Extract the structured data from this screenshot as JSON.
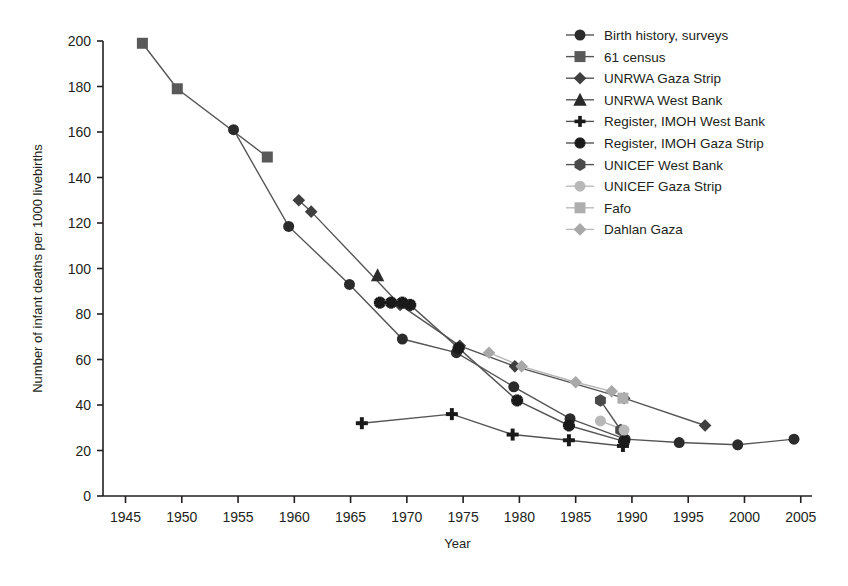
{
  "chart_data": {
    "type": "scatter",
    "title": "",
    "subtitle": "",
    "xlabel": "Year",
    "ylabel": "Number of infant deaths per 1000 livebirths",
    "xlim": [
      1943,
      2006
    ],
    "ylim": [
      0,
      200
    ],
    "xticks": [
      1945,
      1950,
      1955,
      1960,
      1965,
      1970,
      1975,
      1980,
      1985,
      1990,
      1995,
      2000,
      2005
    ],
    "yticks": [
      0,
      20,
      40,
      60,
      80,
      100,
      120,
      140,
      160,
      180,
      200
    ],
    "grid": false,
    "legend_position": "top-right",
    "series": [
      {
        "name": "Birth history, surveys",
        "marker": "circle",
        "color": "#2b2b2b",
        "size": 11,
        "connected": true,
        "points": [
          {
            "x": 1954.6,
            "y": 161
          },
          {
            "x": 1959.5,
            "y": 118.5
          },
          {
            "x": 1964.9,
            "y": 93
          },
          {
            "x": 1969.6,
            "y": 69
          },
          {
            "x": 1974.4,
            "y": 63
          },
          {
            "x": 1979.5,
            "y": 48
          },
          {
            "x": 1984.5,
            "y": 34
          },
          {
            "x": 1989.4,
            "y": 25
          },
          {
            "x": 1994.2,
            "y": 23.5
          },
          {
            "x": 1999.4,
            "y": 22.5
          },
          {
            "x": 2004.4,
            "y": 25
          }
        ]
      },
      {
        "name": "61 census",
        "marker": "square",
        "color": "#595959",
        "size": 11,
        "connected": true,
        "points": [
          {
            "x": 1946.5,
            "y": 199
          },
          {
            "x": 1949.6,
            "y": 179
          },
          {
            "x": 1957.6,
            "y": 149
          }
        ]
      },
      {
        "name": "UNRWA Gaza Strip",
        "marker": "diamond",
        "color": "#3f3f3f",
        "size": 11,
        "connected": true,
        "points": [
          {
            "x": 1960.4,
            "y": 130
          },
          {
            "x": 1961.5,
            "y": 125
          },
          {
            "x": 1969.4,
            "y": 84
          },
          {
            "x": 1974.7,
            "y": 66
          },
          {
            "x": 1979.6,
            "y": 57
          },
          {
            "x": 1989.3,
            "y": 43
          },
          {
            "x": 1996.5,
            "y": 31
          }
        ]
      },
      {
        "name": "UNRWA West Bank",
        "marker": "triangle",
        "color": "#2b2b2b",
        "size": 11,
        "connected": false,
        "points": [
          {
            "x": 1967.4,
            "y": 97
          }
        ]
      },
      {
        "name": "Register, IMOH West Bank",
        "marker": "plus",
        "color": "#1a1a1a",
        "size": 12,
        "connected": true,
        "points": [
          {
            "x": 1966.0,
            "y": 32
          },
          {
            "x": 1974.0,
            "y": 36
          },
          {
            "x": 1979.4,
            "y": 27
          },
          {
            "x": 1984.4,
            "y": 24.5
          },
          {
            "x": 1989.2,
            "y": 22
          }
        ]
      },
      {
        "name": "Register, IMOH Gaza Strip",
        "marker": "cross",
        "color": "#1a1a1a",
        "size": 12,
        "connected": true,
        "points": [
          {
            "x": 1967.6,
            "y": 85
          },
          {
            "x": 1968.6,
            "y": 85
          },
          {
            "x": 1969.6,
            "y": 85
          },
          {
            "x": 1970.3,
            "y": 84
          },
          {
            "x": 1974.6,
            "y": 65
          },
          {
            "x": 1979.8,
            "y": 42
          },
          {
            "x": 1984.4,
            "y": 31
          },
          {
            "x": 1989.3,
            "y": 24
          }
        ]
      },
      {
        "name": "UNICEF West Bank",
        "marker": "hexagon",
        "color": "#4a4a4a",
        "size": 11,
        "connected": true,
        "points": [
          {
            "x": 1987.2,
            "y": 42
          },
          {
            "x": 1989.0,
            "y": 29
          }
        ]
      },
      {
        "name": "UNICEF Gaza Strip",
        "marker": "circle",
        "color": "#b8b8b8",
        "size": 11,
        "connected": true,
        "points": [
          {
            "x": 1987.2,
            "y": 33
          },
          {
            "x": 1989.3,
            "y": 29
          }
        ]
      },
      {
        "name": "Fafo",
        "marker": "square",
        "color": "#aeaeae",
        "size": 11,
        "connected": false,
        "points": [
          {
            "x": 1989.2,
            "y": 43
          }
        ]
      },
      {
        "name": "Dahlan Gaza",
        "marker": "diamond",
        "color": "#a8a8a8",
        "size": 11,
        "connected": true,
        "points": [
          {
            "x": 1977.3,
            "y": 63
          },
          {
            "x": 1980.2,
            "y": 57
          },
          {
            "x": 1985.0,
            "y": 50
          },
          {
            "x": 1988.2,
            "y": 46
          }
        ]
      }
    ]
  },
  "legend": {
    "items": [
      {
        "label": "Birth history, surveys",
        "marker": "circle",
        "color": "#2b2b2b"
      },
      {
        "label": "61 census",
        "marker": "square",
        "color": "#595959"
      },
      {
        "label": "UNRWA Gaza Strip",
        "marker": "diamond",
        "color": "#3f3f3f"
      },
      {
        "label": "UNRWA West Bank",
        "marker": "triangle",
        "color": "#2b2b2b"
      },
      {
        "label": "Register, IMOH West Bank",
        "marker": "plus",
        "color": "#1a1a1a"
      },
      {
        "label": "Register, IMOH Gaza Strip",
        "marker": "cross",
        "color": "#1a1a1a"
      },
      {
        "label": "UNICEF West Bank",
        "marker": "hexagon",
        "color": "#4a4a4a"
      },
      {
        "label": "UNICEF Gaza Strip",
        "marker": "circle",
        "color": "#b8b8b8"
      },
      {
        "label": "Fafo",
        "marker": "square",
        "color": "#aeaeae"
      },
      {
        "label": "Dahlan Gaza",
        "marker": "diamond",
        "color": "#a8a8a8"
      }
    ]
  },
  "axes": {
    "x_title": "Year",
    "y_title": "Number of infant deaths per 1000 livebirths"
  }
}
